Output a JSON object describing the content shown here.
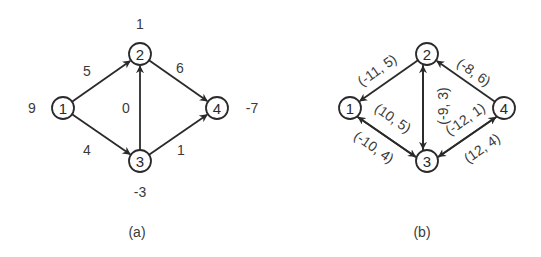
{
  "diagrams": [
    {
      "caption": "(a)",
      "nodes": [
        {
          "id": "1",
          "label": "1",
          "x": 63,
          "y": 108,
          "supply": "9",
          "sx": 32,
          "sy": 108
        },
        {
          "id": "2",
          "label": "2",
          "x": 140,
          "y": 54,
          "supply": "1",
          "sx": 140,
          "sy": 24
        },
        {
          "id": "3",
          "label": "3",
          "x": 140,
          "y": 161,
          "supply": "-3",
          "sx": 140,
          "sy": 192
        },
        {
          "id": "4",
          "label": "4",
          "x": 217,
          "y": 108,
          "supply": "-7",
          "sx": 252,
          "sy": 108
        }
      ],
      "edges": [
        {
          "from": "1",
          "to": "2",
          "label": "5",
          "lx": 87,
          "ly": 71,
          "rot": 0
        },
        {
          "from": "1",
          "to": "3",
          "label": "4",
          "lx": 87,
          "ly": 150,
          "rot": 0
        },
        {
          "from": "3",
          "to": "2",
          "label": "0",
          "lx": 126,
          "ly": 108,
          "rot": 0
        },
        {
          "from": "2",
          "to": "4",
          "label": "6",
          "lx": 180,
          "ly": 68,
          "rot": 0
        },
        {
          "from": "3",
          "to": "4",
          "label": "1",
          "lx": 181,
          "ly": 150,
          "rot": 0
        }
      ]
    },
    {
      "caption": "(b)",
      "nodes": [
        {
          "id": "1",
          "label": "1",
          "x": 350,
          "y": 108
        },
        {
          "id": "2",
          "label": "2",
          "x": 427,
          "y": 54
        },
        {
          "id": "3",
          "label": "3",
          "x": 427,
          "y": 161
        },
        {
          "id": "4",
          "label": "4",
          "x": 504,
          "y": 108
        }
      ],
      "edges": [
        {
          "from": "2",
          "to": "1",
          "label": "(-11, 5)",
          "lx": 377,
          "ly": 70,
          "rot": -35,
          "offset": 0
        },
        {
          "from": "1",
          "to": "3",
          "label": "(10, 5)",
          "lx": 393,
          "ly": 118,
          "rot": 35,
          "offset": 3
        },
        {
          "from": "3",
          "to": "1",
          "label": "(-10, 4)",
          "lx": 374,
          "ly": 147,
          "rot": 35,
          "offset": -3
        },
        {
          "from": "3",
          "to": "2",
          "label": "",
          "lx": 0,
          "ly": 0,
          "rot": 0,
          "offset": -4
        },
        {
          "from": "2",
          "to": "3",
          "label": "(-9, 3)",
          "lx": 443,
          "ly": 106,
          "rot": -90,
          "offset": 4
        },
        {
          "from": "4",
          "to": "2",
          "label": "(-8, 6)",
          "lx": 474,
          "ly": 72,
          "rot": 35,
          "offset": 0
        },
        {
          "from": "4",
          "to": "3",
          "label": "(-12, 1)",
          "lx": 465,
          "ly": 119,
          "rot": -35,
          "offset": -3
        },
        {
          "from": "3",
          "to": "4",
          "label": "(12, 4)",
          "lx": 482,
          "ly": 148,
          "rot": -35,
          "offset": 3
        }
      ]
    }
  ],
  "captions": {
    "a": {
      "text": "(a)",
      "x": 137,
      "y": 232
    },
    "b": {
      "text": "(b)",
      "x": 422,
      "y": 232
    }
  }
}
